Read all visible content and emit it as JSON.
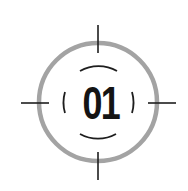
{
  "target_icon": {
    "label": "01",
    "colors": {
      "ring": "#a3a3a3",
      "lines": "#1e1e1e",
      "text": "#141414",
      "background": "#ffffff"
    },
    "icon": "crosshair-target-icon"
  }
}
